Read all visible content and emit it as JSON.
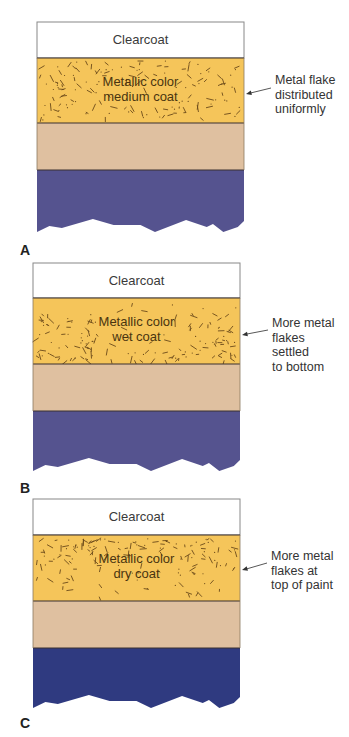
{
  "colors": {
    "clearcoat": "#ffffff",
    "metallic": "#f5c55a",
    "flake": "#6b4a1a",
    "primer": "#dfc0a0",
    "substrate_a": "#55538f",
    "substrate_b": "#55538f",
    "substrate_c": "#2f3a80",
    "outline": "#3a3030"
  },
  "panels": [
    {
      "letter": "A",
      "top": 22,
      "left": 37,
      "width": 207,
      "clear_h": 36,
      "metal_h": 65,
      "primer_h": 47,
      "sub_h": 62,
      "clearcoat_label": "Clearcoat",
      "metal_label_line1": "Metallic color",
      "metal_label_line2": "medium coat",
      "annotation": "Metal flake\ndistributed\nuniformly",
      "flake_distribution": "uniform",
      "letter_y": 242,
      "annot_top": 73,
      "arrow": {
        "x1": 271,
        "y1": 88,
        "x2": 246,
        "y2": 94
      }
    },
    {
      "letter": "B",
      "top": 263,
      "left": 33,
      "width": 207,
      "clear_h": 35,
      "metal_h": 66,
      "primer_h": 47,
      "sub_h": 60,
      "clearcoat_label": "Clearcoat",
      "metal_label_line1": "Metallic color",
      "metal_label_line2": "wet coat",
      "annotation": "More metal\nflakes\nsettled\nto bottom",
      "flake_distribution": "bottom",
      "letter_y": 480,
      "annot_top": 316,
      "arrow": {
        "x1": 268,
        "y1": 330,
        "x2": 242,
        "y2": 335
      }
    },
    {
      "letter": "C",
      "top": 499,
      "left": 33,
      "width": 207,
      "clear_h": 36,
      "metal_h": 66,
      "primer_h": 47,
      "sub_h": 60,
      "clearcoat_label": "Clearcoat",
      "metal_label_line1": "Metallic color",
      "metal_label_line2": "dry coat",
      "annotation": "More metal\nflakes at\ntop of paint",
      "flake_distribution": "top",
      "letter_y": 715,
      "annot_top": 549,
      "arrow": {
        "x1": 267,
        "y1": 563,
        "x2": 242,
        "y2": 570
      }
    }
  ]
}
